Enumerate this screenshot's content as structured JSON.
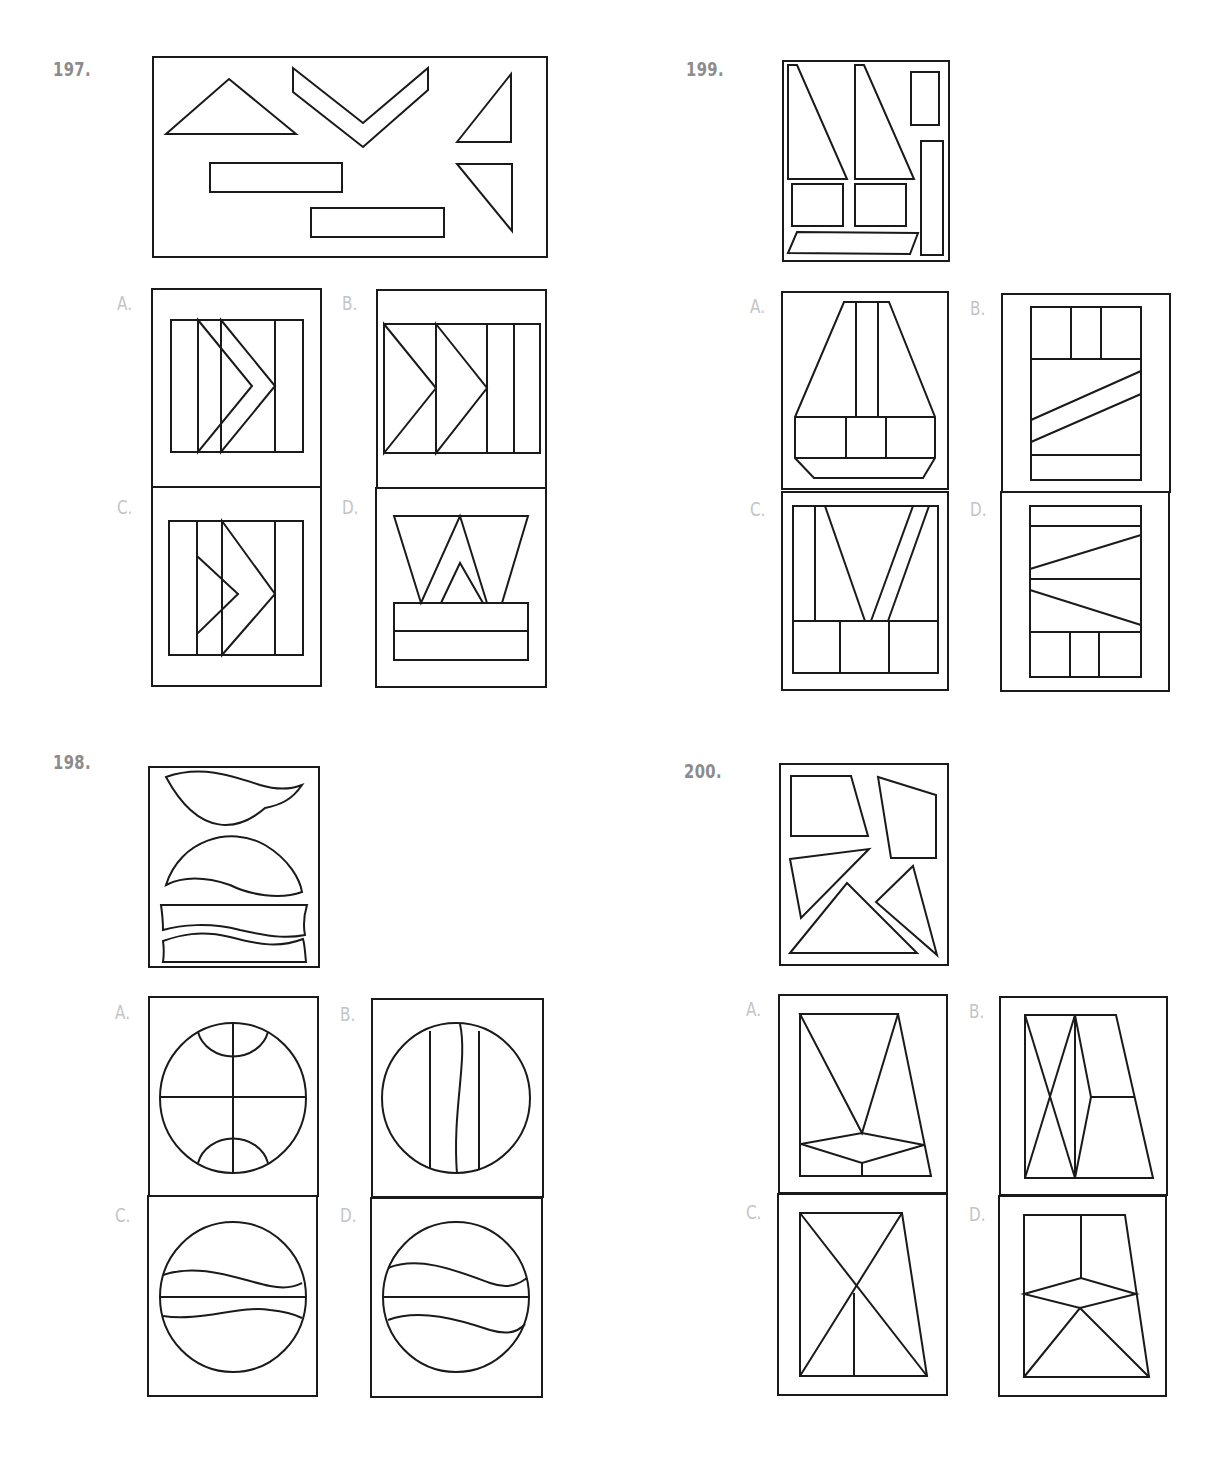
{
  "problems": [
    {
      "number": "197.",
      "pos": [
        53,
        57
      ]
    },
    {
      "number": "199.",
      "pos": [
        686,
        57
      ]
    },
    {
      "number": "198.",
      "pos": [
        53,
        750
      ]
    },
    {
      "number": "200.",
      "pos": [
        684,
        759
      ]
    }
  ],
  "option_labels": [
    {
      "text": "A.",
      "pos": [
        117,
        292
      ]
    },
    {
      "text": "B.",
      "pos": [
        342,
        292
      ]
    },
    {
      "text": "C.",
      "pos": [
        117,
        496
      ]
    },
    {
      "text": "D.",
      "pos": [
        342,
        496
      ]
    },
    {
      "text": "A.",
      "pos": [
        750,
        295
      ]
    },
    {
      "text": "B.",
      "pos": [
        970,
        297
      ]
    },
    {
      "text": "C.",
      "pos": [
        750,
        498
      ]
    },
    {
      "text": "D.",
      "pos": [
        970,
        498
      ]
    },
    {
      "text": "A.",
      "pos": [
        115,
        1001
      ]
    },
    {
      "text": "B.",
      "pos": [
        340,
        1003
      ]
    },
    {
      "text": "C.",
      "pos": [
        115,
        1204
      ]
    },
    {
      "text": "D.",
      "pos": [
        340,
        1204
      ]
    },
    {
      "text": "A.",
      "pos": [
        746,
        998
      ]
    },
    {
      "text": "B.",
      "pos": [
        969,
        1000
      ]
    },
    {
      "text": "C.",
      "pos": [
        746,
        1201
      ]
    },
    {
      "text": "D.",
      "pos": [
        969,
        1203
      ]
    }
  ],
  "figures": {
    "p197_stem": [
      "R 153 57 394 200",
      "P 166,134 229,79 296,134",
      "P 293,68 363,123 428,68 428,90 363,147 293,92",
      "P 457,142 511,74 511,142",
      "P 457,164 512,164 512,231",
      "R 210 163 132 29",
      "R 311 208 133 29"
    ],
    "p197_A": [
      "R 152 289 169 198",
      "R 171 320 132 132",
      "L 198 320 198 452",
      "L 275 320 275 452",
      "P 198,320 252,386 198,452",
      "P 221,320 275,386 221,452"
    ],
    "p197_B": [
      "R 377 290 169 198",
      "R 384 324 156 129",
      "L 436 324 436 453",
      "L 487 324 487 453",
      "L 514 324 514 453",
      "P 384,324 436,388 384,453",
      "P 436,324 487,388 436,453"
    ],
    "p197_C": [
      "R 152 487 169 199",
      "R 169 521 134 134",
      "L 197 521 197 655",
      "L 275 521 275 655",
      "P 197,556 238,594 197,634",
      "P 222,521 275,594 222,655"
    ],
    "p197_D": [
      "R 376 488 170 199",
      "P 394,516 528,516 502,603 487,603 460,516 421,603",
      "P 441,603 460,563 483,603",
      "R 394 603 134 57",
      "L 394 631 528 631"
    ],
    "p199_stem": [
      "R 783 61 166 200",
      "P 788,65 797,65 847,179 788,179",
      "P 855,65 864,65 914,179 855,179",
      "R 911 72 28 53",
      "R 921 141 22 114",
      "R 792 184 51 42",
      "R 855 184 51 42",
      "P 797,232 918,233 910,254 788,253"
    ],
    "p199_A": [
      "R 782 292 166 197",
      "P 844,302 889,302 935,417 935,458 923,478 814,478 795,458 795,417",
      "L 795 417 935 417",
      "L 795 458 935 458",
      "L 856 302 856 417",
      "L 878 302 878 417",
      "L 846 417 846 458",
      "L 886 417 886 458"
    ],
    "p199_B": [
      "R 1002 294 168 198",
      "R 1031 307 110 173",
      "L 1031 359 1141 359",
      "L 1071 307 1071 359",
      "L 1101 307 1101 359",
      "L 1031 420 1141 371",
      "L 1031 442 1141 394",
      "L 1031 455 1141 455"
    ],
    "p199_C": [
      "R 782 492 166 198",
      "R 793 506 145 167",
      "L 793 621 938 621",
      "L 815 506 815 621",
      "L 825 506 865 621",
      "L 871 621 913 506",
      "L 888 621 929 506",
      "L 840 621 840 673",
      "L 889 621 889 673"
    ],
    "p199_D": [
      "R 1001 492 168 199",
      "R 1030 506 111 171",
      "L 1030 526 1141 526",
      "L 1030 579 1141 579",
      "L 1030 632 1141 632",
      "L 1030 569 1141 535",
      "L 1030 590 1141 625",
      "L 1070 632 1070 677",
      "L 1099 632 1099 677"
    ],
    "p198_stem": [
      "R 149 767 170 200",
      "C M166,777 C200,765 230,775 260,785 C280,791 292,789 302,785 C292,800 280,805 265,808 C240,830 200,840 166,777 Z",
      "C M166,885 C180,840 230,825 265,845 C290,860 300,880 302,892 C280,900 250,895 230,885 C200,875 180,878 166,885 Z",
      "C M161,905 L307,905 C304,915 303,925 305,935 C290,938 275,938 240,930 C210,922 180,925 163,930 C163,920 162,912 161,905 Z",
      "C M163,962 L306,962 C305,953 305,946 303,939 C280,948 260,945 230,937 C200,930 180,935 163,941 C164,948 164,955 163,962 Z"
    ],
    "p198_A": [
      "R 149 997 169 199",
      "E 233 1098 73 75",
      "L 160 1097 306 1097",
      "L 233 1023 233 1173",
      "C M198,1032 A36,32 0 0,0 268,1032",
      "C M198,1163 A36,32 0 0,1 268,1163"
    ],
    "p198_B": [
      "R 372 999 171 198",
      "E 456 1098 74 75",
      "L 430 1031 430 1169",
      "L 479 1031 479 1170",
      "C M460,1024 C468,1060 452,1110 457,1174"
    ],
    "p198_C": [
      "R 148 1196 169 200",
      "E 233 1297 73 75",
      "L 160 1297 306 1297",
      "C M163,1275 C200,1262 240,1280 270,1286 C290,1290 298,1285 302,1283",
      "C M163,1316 C200,1322 240,1305 270,1310 C290,1312 298,1316 302,1318"
    ],
    "p198_D": [
      "R 371 1198 171 199",
      "E 456 1297 73 75",
      "L 383 1297 529 1297",
      "C M388,1268 C420,1255 460,1272 490,1283 C510,1290 520,1283 527,1278",
      "C M388,1320 C420,1308 460,1320 490,1330 C510,1336 520,1330 525,1324"
    ],
    "p200_stem": [
      "R 780 764 168 201",
      "P 791,776 851,776 868,836 791,836",
      "P 878,777 936,795 936,858 891,858",
      "P 790,859 869,849 801,918",
      "P 913,866 937,955 876,902",
      "P 790,953 847,883 917,953"
    ],
    "p200_A": [
      "R 779 995 168 198",
      "P 800,1014 898,1014 931,1176 800,1176",
      "P 800,1014 862,1133 898,1014",
      "P 801,1144 862,1133 924,1145 862,1163",
      "L 862 1163 862 1176"
    ],
    "p200_B": [
      "R 1000 997 167 198",
      "P 1025,1015 1116,1015 1153,1178 1025,1178",
      "P 1025,1015 1075,1178",
      "P 1075,1015 1025,1178",
      "P 1075,1015 1091,1097 1075,1178",
      "L 1091 1097 1135 1097"
    ],
    "p200_C": [
      "R 778 1194 169 201",
      "P 800,1213 902,1213 927,1376 800,1376",
      "L 800 1213 927 1376",
      "L 902 1213 800 1376",
      "L 854 1293 854 1376"
    ],
    "p200_D": [
      "R 999 1196 167 200",
      "P 1024,1215 1125,1215 1149,1377 1024,1377",
      "L 1081 1215 1081 1278",
      "P 1024,1294 1081,1278 1136,1294 1080,1308 Z",
      "L 1024 1377 1080 1308 1149 1377"
    ]
  }
}
